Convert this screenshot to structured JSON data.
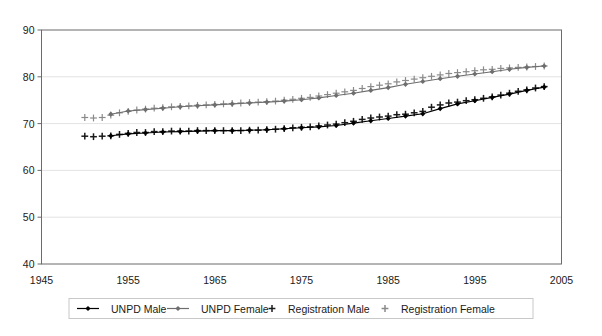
{
  "chart_data": {
    "type": "line",
    "title": "",
    "xlabel": "",
    "ylabel": "",
    "xlim": [
      1945,
      2005
    ],
    "ylim": [
      40,
      90
    ],
    "xticks": [
      "1945",
      "1955",
      "1965",
      "1975",
      "1985",
      "1995",
      "2005"
    ],
    "xtick_values": [
      1945,
      1955,
      1965,
      1975,
      1985,
      1995,
      2005
    ],
    "yticks": [
      "40",
      "50",
      "60",
      "70",
      "80",
      "90"
    ],
    "ytick_values": [
      40,
      50,
      60,
      70,
      80,
      90
    ],
    "grid": "horizontal",
    "legend_position": "bottom",
    "series": [
      {
        "name": "UNPD Male",
        "marker": "diamond",
        "line": true,
        "color": "#000000",
        "x": [
          1953,
          1955,
          1957,
          1959,
          1961,
          1963,
          1965,
          1967,
          1969,
          1971,
          1973,
          1975,
          1977,
          1979,
          1981,
          1983,
          1985,
          1987,
          1989,
          1991,
          1993,
          1995,
          1997,
          1999,
          2001,
          2003
        ],
        "values": [
          67.4,
          67.8,
          68.0,
          68.2,
          68.3,
          68.4,
          68.5,
          68.5,
          68.6,
          68.7,
          68.9,
          69.1,
          69.3,
          69.6,
          70.1,
          70.6,
          71.1,
          71.6,
          72.1,
          73.2,
          74.2,
          74.9,
          75.6,
          76.3,
          77.1,
          77.8
        ]
      },
      {
        "name": "UNPD Female",
        "marker": "diamond",
        "line": true,
        "color": "#6e6e6e",
        "x": [
          1953,
          1955,
          1957,
          1959,
          1961,
          1963,
          1965,
          1967,
          1969,
          1971,
          1973,
          1975,
          1977,
          1979,
          1981,
          1983,
          1985,
          1987,
          1989,
          1991,
          1993,
          1995,
          1997,
          1999,
          2001,
          2003
        ],
        "values": [
          72.0,
          72.7,
          73.0,
          73.3,
          73.6,
          73.8,
          74.0,
          74.2,
          74.4,
          74.6,
          74.8,
          75.1,
          75.5,
          76.0,
          76.5,
          77.1,
          77.7,
          78.4,
          79.0,
          79.6,
          80.1,
          80.6,
          81.1,
          81.6,
          82.0,
          82.3
        ]
      },
      {
        "name": "Registration Male",
        "marker": "plus",
        "line": false,
        "color": "#1a1a1a",
        "x": [
          1950,
          1951,
          1952,
          1953,
          1954,
          1955,
          1956,
          1957,
          1958,
          1959,
          1960,
          1961,
          1962,
          1963,
          1964,
          1965,
          1966,
          1967,
          1968,
          1969,
          1970,
          1971,
          1972,
          1973,
          1974,
          1975,
          1976,
          1977,
          1978,
          1979,
          1980,
          1981,
          1982,
          1983,
          1984,
          1985,
          1986,
          1987,
          1988,
          1989,
          1990,
          1991,
          1992,
          1993,
          1994,
          1995,
          1996,
          1997,
          1998,
          1999,
          2000,
          2001,
          2002,
          2003
        ],
        "values": [
          67.3,
          67.2,
          67.3,
          67.4,
          67.7,
          67.9,
          68.1,
          68.1,
          68.3,
          68.3,
          68.4,
          68.4,
          68.4,
          68.5,
          68.5,
          68.5,
          68.5,
          68.5,
          68.5,
          68.6,
          68.6,
          68.7,
          68.8,
          68.9,
          69.1,
          69.2,
          69.3,
          69.5,
          69.7,
          69.9,
          70.2,
          70.5,
          70.9,
          71.2,
          71.4,
          71.6,
          71.9,
          72.0,
          72.3,
          72.6,
          73.5,
          74.0,
          74.4,
          74.6,
          74.9,
          75.1,
          75.4,
          75.7,
          76.1,
          76.5,
          76.9,
          77.2,
          77.6,
          77.9
        ]
      },
      {
        "name": "Registration Female",
        "marker": "plus",
        "line": false,
        "color": "#8a8a8a",
        "x": [
          1950,
          1951,
          1952,
          1953,
          1954,
          1955,
          1956,
          1957,
          1958,
          1959,
          1960,
          1961,
          1962,
          1963,
          1964,
          1965,
          1966,
          1967,
          1968,
          1969,
          1970,
          1971,
          1972,
          1973,
          1974,
          1975,
          1976,
          1977,
          1978,
          1979,
          1980,
          1981,
          1982,
          1983,
          1984,
          1985,
          1986,
          1987,
          1988,
          1989,
          1990,
          1991,
          1992,
          1993,
          1994,
          1995,
          1996,
          1997,
          1998,
          1999,
          2000,
          2001,
          2002,
          2003
        ],
        "values": [
          71.3,
          71.2,
          71.3,
          71.8,
          72.3,
          72.6,
          72.9,
          73.1,
          73.3,
          73.4,
          73.6,
          73.7,
          73.8,
          73.9,
          74.0,
          74.1,
          74.2,
          74.3,
          74.4,
          74.5,
          74.6,
          74.7,
          74.8,
          75.0,
          75.2,
          75.4,
          75.6,
          75.9,
          76.2,
          76.5,
          76.8,
          77.1,
          77.5,
          77.9,
          78.2,
          78.5,
          78.9,
          79.2,
          79.5,
          79.8,
          80.1,
          80.4,
          80.7,
          80.9,
          81.1,
          81.3,
          81.5,
          81.6,
          81.8,
          81.9,
          82.0,
          82.1,
          82.2,
          82.3
        ]
      }
    ]
  },
  "legend": {
    "items": [
      {
        "label": "UNPD Male"
      },
      {
        "label": "UNPD Female"
      },
      {
        "label": "Registration Male"
      },
      {
        "label": "Registration Female"
      }
    ]
  }
}
